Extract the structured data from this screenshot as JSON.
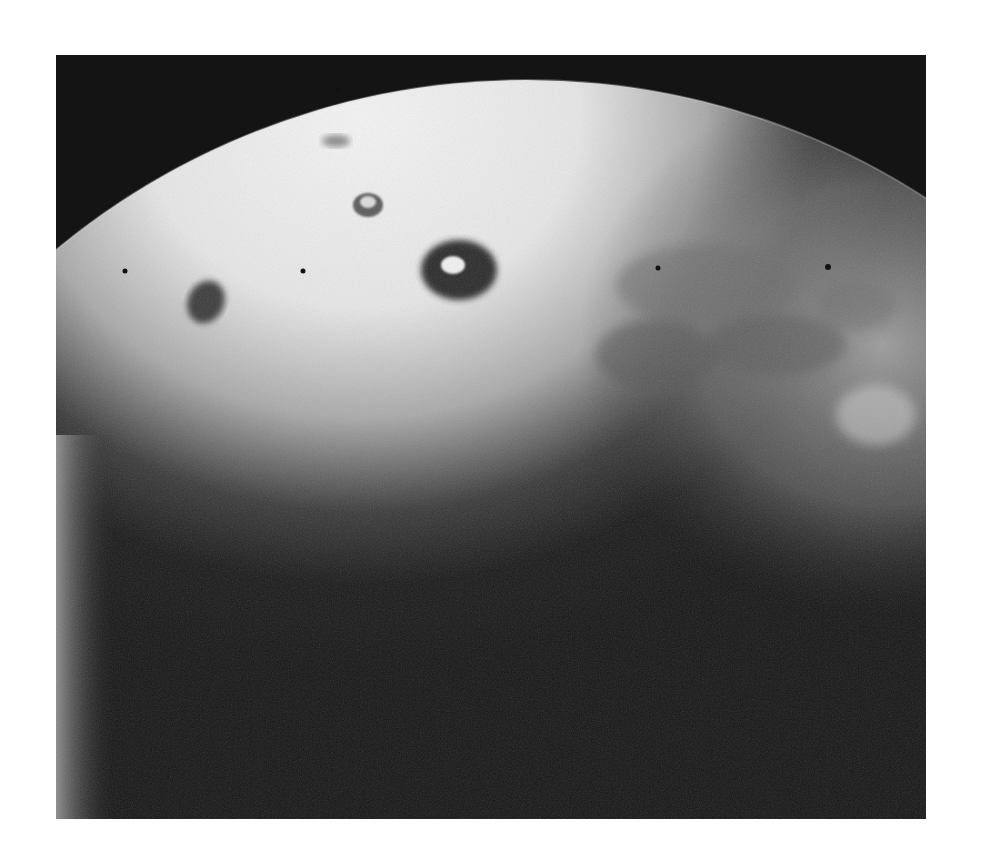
{
  "image": {
    "subject": "planetary body limb (grayscale space photograph)",
    "frame": {
      "x": 56,
      "y": 55,
      "width": 870,
      "height": 764
    },
    "colors": {
      "page_background": "#ffffff",
      "space_background": "#141414",
      "surface_bright": "#efefef",
      "surface_mid": "#9a9a9a",
      "shadow": "#161616"
    },
    "features": [
      {
        "name": "dark-ring-bright-center-spot",
        "cx": 403,
        "cy": 212,
        "rx": 40,
        "ry": 30
      },
      {
        "name": "small-ring-spot",
        "cx": 310,
        "cy": 148,
        "rx": 15,
        "ry": 12
      },
      {
        "name": "faint-gray-spot",
        "cx": 280,
        "cy": 86,
        "rx": 14,
        "ry": 7
      },
      {
        "name": "dark-oval-spot",
        "cx": 150,
        "cy": 247,
        "rx": 20,
        "ry": 24
      }
    ],
    "reseau_marks": [
      {
        "cx": 69,
        "cy": 216
      },
      {
        "cx": 247,
        "cy": 216
      },
      {
        "cx": 602,
        "cy": 213
      },
      {
        "cx": 772,
        "cy": 212
      },
      {
        "cx": 282,
        "cy": 34
      }
    ]
  }
}
